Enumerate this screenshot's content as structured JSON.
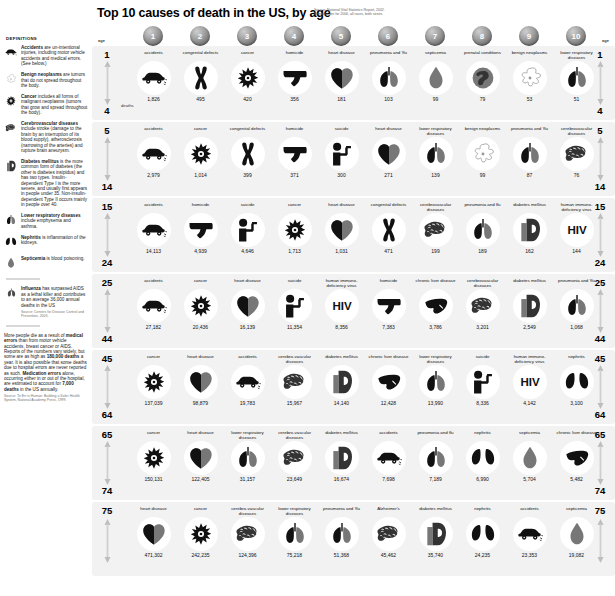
{
  "header": {
    "title": "Top 10 causes of death in the US, by age",
    "source_line1": "Source: National Vital Statistics Report, 2002.",
    "source_line2": "Numbers are for 2000, all races, both sexes."
  },
  "ranks": [
    "1",
    "2",
    "3",
    "4",
    "5",
    "6",
    "7",
    "8",
    "9",
    "10"
  ],
  "age_label": "age",
  "deaths_label": "deaths",
  "sidebar": {
    "definitions_title": "DEFINITIONS",
    "definitions": [
      {
        "icon": "accident-car-icon",
        "term": "Accidents",
        "text": " are un-intentional injuries, including motor vehicle accidents and medical errors. (See below.)"
      },
      {
        "icon": "benign-neoplasm-icon",
        "term": "Benign neoplasms",
        "text": " are tumors that do not spread throughout the body."
      },
      {
        "icon": "cancer-cell-icon",
        "term": "Cancer",
        "text": " includes all forms of malignant neoplasms (tumors that grow and spread throughout the body)."
      },
      {
        "icon": "brain-icon",
        "term": "Cerebrovascular diseases",
        "text": " include stroke (damage to the brain by an interruption of its blood supply), atherosclerosis (narrowing of the arteries) and rupture brain aneurysm."
      },
      {
        "icon": "diabetes-d-icon",
        "term": "Diabetes mellitus",
        "text": " is the more common form of diabetes (the other is diabetes insipidus) and has two types. Insulin-dependent Type I is the more severe, and usually first appears in people under 35. Non-insulin-dependent Type II occurs mainly in people over 40."
      },
      {
        "icon": "lungs-icon",
        "term": "Lower respiratory diseases",
        "text": " include emphysema and asthma."
      },
      {
        "icon": "kidneys-icon",
        "term": "Nephritis",
        "text": " is inflammation of the kidneys."
      },
      {
        "icon": "blood-drop-icon",
        "term": "Septicemia",
        "text": " is blood poisoning."
      }
    ],
    "influenza_note": {
      "icon": "lungs-icon",
      "term": "Influenza",
      "text": " has surpassed AIDS as a lethal killer and contributes to an average 36,000 annual deaths in the US",
      "source": "Source: Centers for Disease Control and Prevention, 2003."
    },
    "medical_errors_note": {
      "lead": "More people die as a result of ",
      "bold1": "medical errors",
      "mid1": " than from motor vehicle accidents, breast cancer or AIDS. Reports of the numbers vary widely, but some are as high as ",
      "bold2": "180,000 deaths",
      "mid2": " a year. It is also possible that some deaths due to hospital errors are never reported as such. ",
      "bold3": "Medication errors",
      "mid3": " alone, occurring either in or out of the hospital, are estimated to account for ",
      "bold4": "7,000 deaths",
      "mid4": " in the US annually.",
      "source": "Source: To Err is Human: Building a Safer Health System, National Academy Press, 1999."
    }
  },
  "chart_data": {
    "type": "table",
    "title": "Top 10 causes of death in the US, by age",
    "ylabel": "age group",
    "xlabel": "rank",
    "columns": [
      "1",
      "2",
      "3",
      "4",
      "5",
      "6",
      "7",
      "8",
      "9",
      "10"
    ],
    "rows": [
      {
        "age_from": "1",
        "age_to": "4",
        "causes": [
          {
            "name": "accidents",
            "icon": "accident-car-icon",
            "deaths": "1,826"
          },
          {
            "name": "congenital defects",
            "icon": "chromosome-icon",
            "deaths": "495"
          },
          {
            "name": "cancer",
            "icon": "cancer-cell-icon",
            "deaths": "420"
          },
          {
            "name": "homicide",
            "icon": "gun-icon",
            "deaths": "356"
          },
          {
            "name": "heart disease",
            "icon": "heart-icon",
            "deaths": "181"
          },
          {
            "name": "pneumonia and 'flu",
            "icon": "lungs-icon",
            "deaths": "103"
          },
          {
            "name": "septicemia",
            "icon": "blood-drop-icon",
            "deaths": "99"
          },
          {
            "name": "prenatal conditions",
            "icon": "fetus-icon",
            "deaths": "79"
          },
          {
            "name": "benign neoplasms",
            "icon": "benign-neoplasm-icon",
            "deaths": "53"
          },
          {
            "name": "lower respiratory diseases",
            "icon": "lungs-icon",
            "deaths": "51"
          }
        ]
      },
      {
        "age_from": "5",
        "age_to": "14",
        "causes": [
          {
            "name": "accidents",
            "icon": "accident-car-icon",
            "deaths": "2,979"
          },
          {
            "name": "cancer",
            "icon": "cancer-cell-icon",
            "deaths": "1,014"
          },
          {
            "name": "congenital defects",
            "icon": "chromosome-icon",
            "deaths": "399"
          },
          {
            "name": "homicide",
            "icon": "gun-icon",
            "deaths": "371"
          },
          {
            "name": "suicide",
            "icon": "suicide-icon",
            "deaths": "300"
          },
          {
            "name": "heart disease",
            "icon": "heart-icon",
            "deaths": "271"
          },
          {
            "name": "lower respiratory diseases",
            "icon": "lungs-icon",
            "deaths": "139"
          },
          {
            "name": "benign neoplasms",
            "icon": "benign-neoplasm-icon",
            "deaths": "99"
          },
          {
            "name": "pneumonia and 'flu",
            "icon": "lungs-icon",
            "deaths": "87"
          },
          {
            "name": "cerebrovascular diseases",
            "icon": "brain-icon",
            "deaths": "76"
          }
        ]
      },
      {
        "age_from": "15",
        "age_to": "24",
        "causes": [
          {
            "name": "accidents",
            "icon": "accident-car-icon",
            "deaths": "14,113"
          },
          {
            "name": "homicide",
            "icon": "gun-icon",
            "deaths": "4,939"
          },
          {
            "name": "suicide",
            "icon": "suicide-icon",
            "deaths": "4,646"
          },
          {
            "name": "cancer",
            "icon": "cancer-cell-icon",
            "deaths": "1,713"
          },
          {
            "name": "heart disease",
            "icon": "heart-icon",
            "deaths": "1,031"
          },
          {
            "name": "congenital defects",
            "icon": "chromosome-icon",
            "deaths": "471"
          },
          {
            "name": "cerebrovascular diseases",
            "icon": "brain-icon",
            "deaths": "199"
          },
          {
            "name": "pneumonia and flu",
            "icon": "lungs-icon",
            "deaths": "189"
          },
          {
            "name": "diabetes mellitus",
            "icon": "diabetes-d-icon",
            "deaths": "162"
          },
          {
            "name": "human immuno-deficiency virus",
            "icon": "hiv-icon",
            "deaths": "144"
          }
        ]
      },
      {
        "age_from": "25",
        "age_to": "44",
        "causes": [
          {
            "name": "accidents",
            "icon": "accident-car-icon",
            "deaths": "27,182"
          },
          {
            "name": "cancer",
            "icon": "cancer-cell-icon",
            "deaths": "20,436"
          },
          {
            "name": "heart disease",
            "icon": "heart-icon",
            "deaths": "16,139"
          },
          {
            "name": "suicide",
            "icon": "suicide-icon",
            "deaths": "11,354"
          },
          {
            "name": "human immuno-deficiency virus",
            "icon": "hiv-icon",
            "deaths": "8,356"
          },
          {
            "name": "homicide",
            "icon": "gun-icon",
            "deaths": "7,383"
          },
          {
            "name": "chronic liver disease",
            "icon": "liver-icon",
            "deaths": "3,786"
          },
          {
            "name": "cerebrovascular diseases",
            "icon": "brain-icon",
            "deaths": "3,201"
          },
          {
            "name": "diabetes mellitus",
            "icon": "diabetes-d-icon",
            "deaths": "2,549"
          },
          {
            "name": "pneumonia and 'flu",
            "icon": "lungs-icon",
            "deaths": "1,068"
          }
        ]
      },
      {
        "age_from": "45",
        "age_to": "64",
        "causes": [
          {
            "name": "cancer",
            "icon": "cancer-cell-icon",
            "deaths": "137,039"
          },
          {
            "name": "heart disease",
            "icon": "heart-icon",
            "deaths": "98,879"
          },
          {
            "name": "accidents",
            "icon": "accident-car-icon",
            "deaths": "19,783"
          },
          {
            "name": "cerebro-vascular diseases",
            "icon": "brain-icon",
            "deaths": "15,967"
          },
          {
            "name": "diabetes mellitus",
            "icon": "diabetes-d-icon",
            "deaths": "14,140"
          },
          {
            "name": "chronic liver disease",
            "icon": "liver-icon",
            "deaths": "12,428"
          },
          {
            "name": "lower respiratory diseases",
            "icon": "lungs-icon",
            "deaths": "13,990"
          },
          {
            "name": "suicide",
            "icon": "suicide-icon",
            "deaths": "8,336"
          },
          {
            "name": "human immuno-deficiency virus",
            "icon": "hiv-icon",
            "deaths": "4,142"
          },
          {
            "name": "nephritis",
            "icon": "kidneys-icon",
            "deaths": "3,100"
          }
        ]
      },
      {
        "age_from": "65",
        "age_to": "74",
        "causes": [
          {
            "name": "cancer",
            "icon": "cancer-cell-icon",
            "deaths": "150,131"
          },
          {
            "name": "heart disease",
            "icon": "heart-icon",
            "deaths": "122,405"
          },
          {
            "name": "lower respiratory diseases",
            "icon": "lungs-icon",
            "deaths": "31,157"
          },
          {
            "name": "cerebro-vascular diseases",
            "icon": "brain-icon",
            "deaths": "23,649"
          },
          {
            "name": "diabetes mellitus",
            "icon": "diabetes-d-icon",
            "deaths": "16,674"
          },
          {
            "name": "accidents",
            "icon": "accident-car-icon",
            "deaths": "7,698"
          },
          {
            "name": "pneumonia and flu",
            "icon": "lungs-icon",
            "deaths": "7,189"
          },
          {
            "name": "nephritis",
            "icon": "kidneys-icon",
            "deaths": "6,990"
          },
          {
            "name": "septicemia",
            "icon": "blood-drop-icon",
            "deaths": "5,704"
          },
          {
            "name": "chronic liver disease",
            "icon": "liver-icon",
            "deaths": "5,482"
          }
        ]
      },
      {
        "age_from": "75",
        "age_to": "75",
        "causes": [
          {
            "name": "heart disease",
            "icon": "heart-icon",
            "deaths": "471,302"
          },
          {
            "name": "cancer",
            "icon": "cancer-cell-icon",
            "deaths": "242,235"
          },
          {
            "name": "cerebro-vascular diseases",
            "icon": "brain-icon",
            "deaths": "124,396"
          },
          {
            "name": "lower respiratory diseases",
            "icon": "lungs-icon",
            "deaths": "75,218"
          },
          {
            "name": "pneumonia and 'flu",
            "icon": "lungs-icon",
            "deaths": "51,368"
          },
          {
            "name": "Alzheimer's",
            "icon": "brain-icon",
            "deaths": "45,462"
          },
          {
            "name": "diabetes mellitus",
            "icon": "diabetes-d-icon",
            "deaths": "35,740"
          },
          {
            "name": "nephritis",
            "icon": "kidneys-icon",
            "deaths": "24,235"
          },
          {
            "name": "accidents",
            "icon": "accident-car-icon",
            "deaths": "23,353"
          },
          {
            "name": "septicemia",
            "icon": "blood-drop-icon",
            "deaths": "19,082"
          }
        ]
      }
    ]
  }
}
